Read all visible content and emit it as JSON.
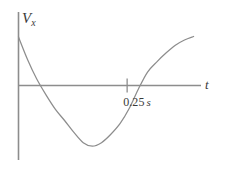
{
  "figure": {
    "background_color": "#ffffff",
    "line_color": "#8d8d8d",
    "text_color": "#3a3a3a",
    "width": 225,
    "height": 170
  },
  "labels": {
    "y_axis_symbol": "V",
    "y_axis_subscript": "x",
    "x_axis_symbol": "t",
    "tick_number": "0.25",
    "tick_unit": "s"
  },
  "chart_data": {
    "type": "line",
    "title": "",
    "subtitle": "",
    "xlabel": "t",
    "ylabel": "Vx",
    "grid": false,
    "legend": null,
    "axis_style": "cartesian-origin-axes",
    "annotations": [
      {
        "name": "zero-crossing-tick",
        "text": "0.25 s",
        "x": 0.25,
        "y": 0,
        "marker": "vertical-tick"
      }
    ],
    "xlim": [
      0,
      0.42
    ],
    "ylim": [
      -0.63,
      0.62
    ],
    "xticks": [
      0.25
    ],
    "xtick_labels": [
      "0.25 s"
    ],
    "yticks": [],
    "ytick_labels": [],
    "series": [
      {
        "name": "v_x(t)",
        "shape": "parabola-opening-upward",
        "vertex": [
          0.145,
          -0.525
        ],
        "zero_crossings": [
          0.0715,
          0.25
        ],
        "x": [
          0.0,
          0.021,
          0.042,
          0.064,
          0.085,
          0.106,
          0.127,
          0.149,
          0.17,
          0.191,
          0.212,
          0.234,
          0.255,
          0.276,
          0.297,
          0.319,
          0.34,
          0.361,
          0.382,
          0.403
        ],
        "y": [
          0.415,
          0.22,
          0.055,
          -0.085,
          -0.205,
          -0.3,
          -0.4,
          -0.49,
          -0.52,
          -0.49,
          -0.42,
          -0.325,
          -0.195,
          -0.03,
          0.115,
          0.205,
          0.28,
          0.345,
          0.39,
          0.42
        ]
      }
    ]
  }
}
